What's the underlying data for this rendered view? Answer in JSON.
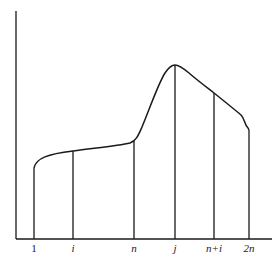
{
  "diagram": {
    "type": "function-curve-with-vertical-markers",
    "axes": {
      "y_axis": {
        "x": 16,
        "y_top": 11,
        "y_bottom": 239
      },
      "x_axis": {
        "y": 239,
        "x_left": 16,
        "x_right": 272
      }
    },
    "stroke_color": "#1a1a1a",
    "markers": [
      {
        "label": "1",
        "italic": false,
        "x": 34,
        "curve_y": 168
      },
      {
        "label": "i",
        "italic": true,
        "x": 73,
        "curve_y": 152
      },
      {
        "label": "n",
        "italic": true,
        "x": 134,
        "curve_y": 140
      },
      {
        "label": "j",
        "italic": true,
        "x": 175,
        "curve_y": 65
      },
      {
        "label": "n+i",
        "italic": true,
        "x": 214,
        "curve_y": 93
      },
      {
        "label": "2n",
        "italic": true,
        "x": 249,
        "curve_y": 130
      }
    ]
  }
}
